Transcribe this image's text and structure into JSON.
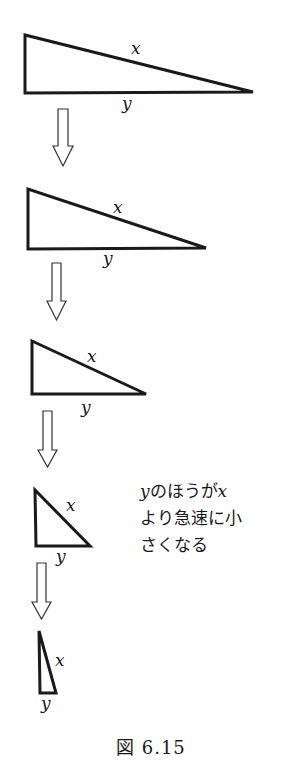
{
  "figure": {
    "caption": "図 6.15",
    "stroke_color": "#1a1a1a",
    "background": "#ffffff",
    "triangles": [
      {
        "label_hypotenuse": "x",
        "label_base": "y",
        "points": "25,35 25,93 253,92"
      },
      {
        "label_hypotenuse": "x",
        "label_base": "y",
        "points": "28,189 28,249 206,248"
      },
      {
        "label_hypotenuse": "x",
        "label_base": "y",
        "points": "32,341 32,394 146,394"
      },
      {
        "label_hypotenuse": "x",
        "label_base": "y",
        "points": "35,490 36,546 90,546"
      },
      {
        "label_hypotenuse": "x",
        "label_base": "y",
        "points": "39,631 40,693 56,693"
      }
    ],
    "arrows": [
      {
        "direction": "down"
      },
      {
        "direction": "down"
      },
      {
        "direction": "down"
      },
      {
        "direction": "down"
      }
    ],
    "annotation": {
      "line1_var_y": "y",
      "line1_text": "のほうが",
      "line1_var_x": "x",
      "line2": "より急速に小",
      "line3": "さくなる"
    }
  }
}
